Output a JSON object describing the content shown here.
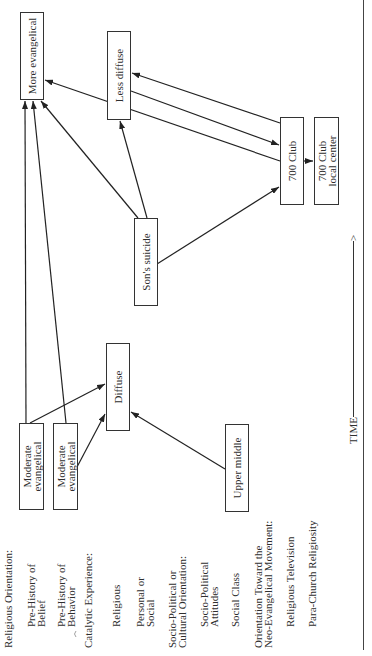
{
  "nodes": {
    "more_evangelical": [
      "More evangelical"
    ],
    "less_diffuse": [
      "Less diffuse"
    ],
    "club_700": [
      "700 Club"
    ],
    "club_700_local": [
      "700 Club",
      "local center"
    ],
    "sons_suicide": [
      "Son's suicide"
    ],
    "diffuse": [
      "Diffuse"
    ],
    "moderate_evangelical_1": [
      "Moderate",
      "evangelical"
    ],
    "moderate_evangelical_2": [
      "Moderate",
      "evangelical"
    ],
    "upper_middle": [
      "Upper middle"
    ]
  },
  "labels": [
    {
      "text": [
        "Religious Orientation:"
      ]
    },
    {
      "text": [
        "Pre-History of",
        "Belief"
      ]
    },
    {
      "text": [
        "Pre-History of",
        "Behavior"
      ]
    },
    {
      "text": [
        "Catalytic Experience:"
      ]
    },
    {
      "text": [
        "Religious"
      ]
    },
    {
      "text": [
        "Personal or",
        "Social"
      ]
    },
    {
      "text": [
        "Socio-Political or",
        "Cultural Orientation:"
      ]
    },
    {
      "text": [
        "Socio-Political",
        "Attitudes"
      ]
    },
    {
      "text": [
        "Social Class"
      ]
    },
    {
      "text": [
        "Orientation Toward the",
        "Neo-Evangelical Movement:"
      ]
    },
    {
      "text": [
        "Religious Television"
      ]
    },
    {
      "text": [
        "Para-Church Religiosity"
      ]
    }
  ],
  "time_axis": {
    "label": "TIME",
    "arrow": ">"
  },
  "edges": [
    {
      "from": "moderate_evangelical_1",
      "to": "more_evangelical"
    },
    {
      "from": "moderate_evangelical_2",
      "to": "more_evangelical"
    },
    {
      "from": "sons_suicide",
      "to": "more_evangelical"
    },
    {
      "from": "sons_suicide",
      "to": "less_diffuse"
    },
    {
      "from": "sons_suicide",
      "to": "club_700"
    },
    {
      "from": "club_700",
      "to": "more_evangelical"
    },
    {
      "from": "club_700",
      "to": "less_diffuse"
    },
    {
      "from": "less_diffuse",
      "to": "club_700"
    },
    {
      "from": "club_700",
      "to": "club_700_local"
    },
    {
      "from": "moderate_evangelical_1",
      "to": "diffuse"
    },
    {
      "from": "moderate_evangelical_2",
      "to": "diffuse"
    },
    {
      "from": "upper_middle",
      "to": "diffuse"
    }
  ],
  "colors": {
    "line": "#222222",
    "text": "#2e2e2e",
    "background": "#ffffff"
  }
}
